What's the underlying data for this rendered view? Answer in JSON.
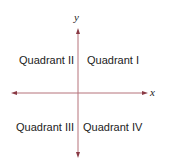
{
  "diagram": {
    "type": "coordinate-plane",
    "axis_color": "#b5727a",
    "axes": {
      "x_label": "x",
      "y_label": "y"
    },
    "quadrants": [
      {
        "id": "I",
        "label": "Quadrant I"
      },
      {
        "id": "II",
        "label": "Quadrant II"
      },
      {
        "id": "III",
        "label": "Quadrant III"
      },
      {
        "id": "IV",
        "label": "Quadrant IV"
      }
    ]
  }
}
